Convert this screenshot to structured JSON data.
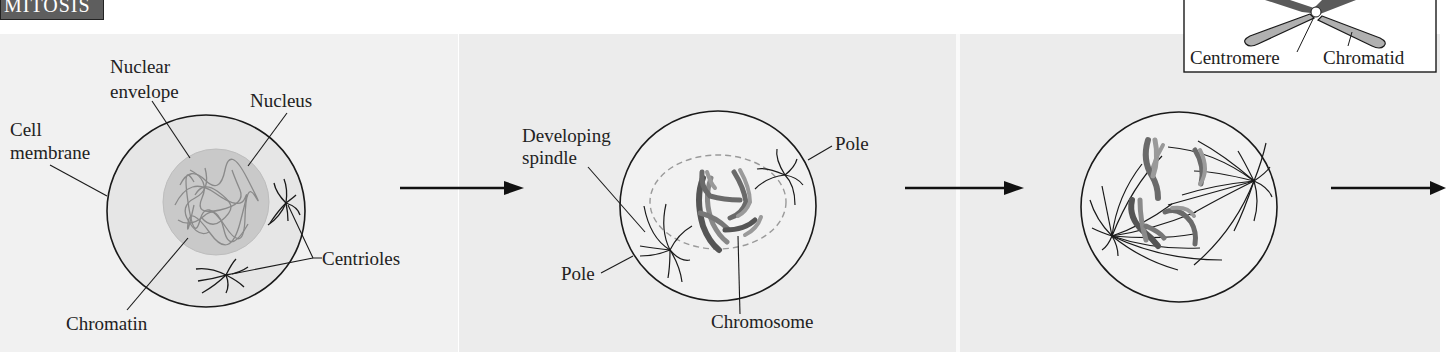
{
  "header": {
    "section_tag": "MITOSIS"
  },
  "colors": {
    "panel_bg": "#ececec",
    "panel_bg_first": "#f1f1f1",
    "tag_bg": "#5e5e5e",
    "line": "#1a1a1a",
    "nucleus_fill": "#c9c9c9",
    "chromosome_dark": "#6a6a6a",
    "chromosome_light": "#a8a8a8"
  },
  "panels": [
    {
      "stage": "interphase",
      "labels": {
        "nuclear_envelope_1": "Nuclear",
        "nuclear_envelope_2": "envelope",
        "nucleus": "Nucleus",
        "cell_membrane_1": "Cell",
        "cell_membrane_2": "membrane",
        "centrioles": "Centrioles",
        "chromatin": "Chromatin"
      }
    },
    {
      "stage": "prophase",
      "labels": {
        "developing_spindle_1": "Developing",
        "developing_spindle_2": "spindle",
        "pole_top": "Pole",
        "pole_bottom": "Pole",
        "chromosome": "Chromosome"
      }
    },
    {
      "stage": "prometaphase",
      "labels": {}
    }
  ],
  "inset": {
    "centromere": "Centromere",
    "chromatid": "Chromatid"
  },
  "arrows": [
    "arrow-1",
    "arrow-2",
    "arrow-3"
  ]
}
